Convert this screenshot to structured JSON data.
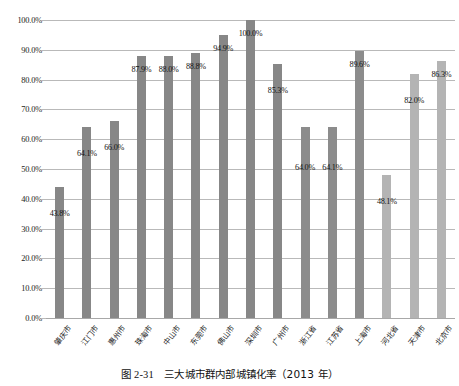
{
  "chart_data": {
    "type": "bar",
    "title": "",
    "xlabel": "",
    "ylabel": "",
    "ylim": [
      0,
      100
    ],
    "ytick_step": 10,
    "grid": true,
    "legend": "none",
    "y_unit": "%",
    "ytick_labels": [
      "100.0%",
      "90.0%",
      "80.0%",
      "70.0%",
      "60.0%",
      "50.0%",
      "40.0%",
      "30.0%",
      "20.0%",
      "10.0%",
      "0.0%"
    ],
    "ytick_values": [
      100,
      90,
      80,
      70,
      60,
      50,
      40,
      30,
      20,
      10,
      0
    ],
    "categories": [
      "肇庆市",
      "江门市",
      "惠州市",
      "珠海市",
      "中山市",
      "东莞市",
      "佛山市",
      "深圳市",
      "广州市",
      "浙江省",
      "江苏省",
      "上海市",
      "河北省",
      "天津市",
      "北京市"
    ],
    "values": [
      43.8,
      64.1,
      66.0,
      87.9,
      88.0,
      88.8,
      94.9,
      100.0,
      85.3,
      64.0,
      64.1,
      89.6,
      48.1,
      82.0,
      86.3
    ],
    "data_labels": [
      "43.8%",
      "64.1%",
      "66.0%",
      "87.9%",
      "88.0%",
      "88.8%",
      "94.9%",
      "100.0%",
      "85.3%",
      "64.0%",
      "64.1%",
      "89.6%",
      "48.1%",
      "82.0%",
      "86.3%"
    ],
    "series_groups": [
      "g1",
      "g1",
      "g1",
      "g1",
      "g1",
      "g1",
      "g1",
      "g1",
      "g1",
      "g2",
      "g2",
      "g2",
      "g3",
      "g3",
      "g3"
    ],
    "colors": {
      "group_pearl_river_delta": "#878787",
      "group_yangtze_river_delta": "#8c8c8c",
      "group_jing_jin_ji": "#b4b4b4",
      "gridline": "#b9b9b9",
      "text": "#111111"
    }
  },
  "caption": {
    "number": "图 2-31",
    "text": "三大城市群内部城镇化率（2013 年）",
    "full": "图 2-31　三大城市群内部城镇化率（2013 年）"
  }
}
